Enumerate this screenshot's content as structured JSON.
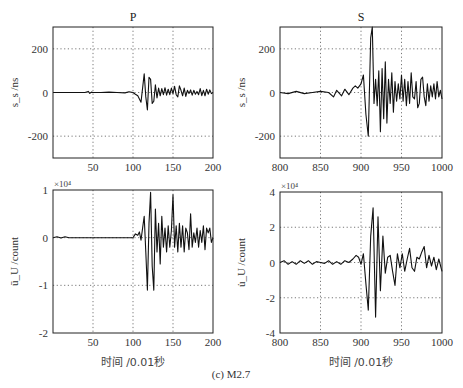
{
  "caption": "(c) M2.7",
  "chart_data": [
    {
      "id": "p-velocity",
      "type": "line",
      "title": "P",
      "xlabel": "",
      "ylabel": "s_s /ns",
      "xlim": [
        0,
        200
      ],
      "ylim": [
        -300,
        300
      ],
      "xticks": [
        50,
        100,
        150,
        200
      ],
      "yticks": [
        -200,
        0,
        200
      ],
      "grid": true,
      "exponent": "",
      "x": [
        0,
        10,
        20,
        30,
        40,
        44,
        46,
        48,
        50,
        60,
        70,
        80,
        90,
        95,
        100,
        103,
        106,
        108,
        110,
        112,
        114,
        116,
        118,
        120,
        122,
        124,
        126,
        128,
        130,
        132,
        134,
        136,
        138,
        140,
        142,
        144,
        146,
        148,
        150,
        152,
        154,
        156,
        158,
        160,
        162,
        164,
        166,
        168,
        170,
        172,
        174,
        176,
        178,
        180,
        182,
        184,
        186,
        188,
        190,
        192,
        194,
        196,
        198,
        200
      ],
      "values": [
        0,
        0,
        0,
        0,
        0,
        5,
        -4,
        2,
        0,
        0,
        2,
        0,
        -2,
        3,
        0,
        -8,
        -15,
        -30,
        -45,
        20,
        85,
        -20,
        -80,
        70,
        60,
        -50,
        -40,
        35,
        -25,
        20,
        -15,
        18,
        -10,
        22,
        -12,
        15,
        -10,
        20,
        -5,
        28,
        -10,
        -20,
        30,
        10,
        -15,
        20,
        -18,
        10,
        -5,
        12,
        -12,
        10,
        -8,
        5,
        -10,
        18,
        -14,
        10,
        -15,
        15,
        -8,
        12,
        -5,
        0
      ]
    },
    {
      "id": "s-velocity",
      "type": "line",
      "title": "S",
      "xlabel": "",
      "ylabel": "s_s /ns",
      "xlim": [
        800,
        1000
      ],
      "ylim": [
        -300,
        300
      ],
      "xticks": [
        800,
        850,
        900,
        950,
        1000
      ],
      "yticks": [
        -200,
        0,
        200
      ],
      "grid": true,
      "exponent": "",
      "x": [
        800,
        810,
        820,
        830,
        840,
        850,
        860,
        866,
        870,
        876,
        880,
        885,
        890,
        893,
        896,
        900,
        903,
        906,
        909,
        912,
        914,
        916,
        918,
        920,
        922,
        924,
        926,
        928,
        930,
        932,
        934,
        936,
        938,
        940,
        942,
        944,
        946,
        948,
        950,
        952,
        954,
        956,
        958,
        960,
        962,
        964,
        966,
        968,
        970,
        972,
        974,
        976,
        978,
        980,
        982,
        984,
        986,
        988,
        990,
        992,
        994,
        996,
        998,
        1000
      ],
      "values": [
        0,
        -5,
        5,
        -5,
        0,
        5,
        0,
        -20,
        10,
        -15,
        15,
        -10,
        20,
        30,
        20,
        40,
        80,
        -100,
        -200,
        250,
        300,
        -50,
        60,
        -60,
        100,
        -180,
        110,
        -120,
        140,
        -140,
        60,
        -50,
        90,
        -90,
        50,
        -40,
        40,
        -30,
        80,
        -40,
        60,
        -60,
        50,
        -50,
        90,
        -20,
        -30,
        50,
        -70,
        -50,
        60,
        70,
        -20,
        -60,
        40,
        -40,
        30,
        -20,
        40,
        -30,
        50,
        -20,
        10,
        -30
      ]
    },
    {
      "id": "p-acceleration",
      "type": "line",
      "title": "",
      "xlabel": "时间 /0.01秒",
      "ylabel": "ū_U /count",
      "xlim": [
        0,
        200
      ],
      "ylim": [
        -2,
        1
      ],
      "xticks": [
        50,
        100,
        150,
        200
      ],
      "yticks": [
        -2,
        -1,
        0,
        1
      ],
      "grid": true,
      "exponent": "×10⁴",
      "x": [
        0,
        5,
        10,
        15,
        20,
        30,
        40,
        50,
        60,
        70,
        80,
        90,
        100,
        103,
        106,
        108,
        110,
        112,
        114,
        116,
        118,
        120,
        122,
        124,
        126,
        128,
        130,
        132,
        134,
        136,
        138,
        140,
        142,
        144,
        146,
        148,
        150,
        152,
        154,
        156,
        158,
        160,
        162,
        164,
        166,
        168,
        170,
        172,
        174,
        176,
        178,
        180,
        182,
        184,
        186,
        188,
        190,
        192,
        194,
        196,
        198,
        200
      ],
      "values": [
        0,
        0.02,
        -0.01,
        0.02,
        0,
        0,
        0,
        0,
        0,
        0,
        0,
        0,
        0,
        0.08,
        0.05,
        0.12,
        -0.05,
        0.2,
        0.45,
        -0.3,
        -1.1,
        0.3,
        0.95,
        -0.6,
        -1.1,
        0.6,
        -0.3,
        0.3,
        -0.55,
        0.45,
        -0.2,
        0.2,
        -0.3,
        0.25,
        -0.2,
        0.15,
        0.9,
        -0.2,
        0.25,
        -0.3,
        0.3,
        -0.2,
        0.25,
        -0.3,
        0.2,
        0.1,
        -0.25,
        0.5,
        -0.2,
        0.1,
        -0.1,
        0.2,
        -0.2,
        0.15,
        -0.1,
        0.25,
        -0.25,
        0.2,
        0.1,
        0.2,
        -0.1,
        0
      ]
    },
    {
      "id": "s-acceleration",
      "type": "line",
      "title": "",
      "xlabel": "时间 /0.01秒",
      "ylabel": "u̇_U /count",
      "xlim": [
        800,
        1000
      ],
      "ylim": [
        -4,
        4
      ],
      "xticks": [
        800,
        850,
        900,
        950,
        1000
      ],
      "yticks": [
        -4,
        -2,
        0,
        2,
        4
      ],
      "grid": true,
      "exponent": "×10⁴",
      "x": [
        800,
        805,
        810,
        815,
        820,
        825,
        830,
        835,
        840,
        845,
        850,
        855,
        860,
        865,
        870,
        875,
        880,
        885,
        890,
        894,
        897,
        900,
        903,
        906,
        909,
        912,
        915,
        918,
        921,
        924,
        927,
        930,
        933,
        936,
        939,
        942,
        945,
        948,
        951,
        954,
        957,
        960,
        963,
        966,
        969,
        972,
        975,
        978,
        981,
        984,
        987,
        990,
        993,
        996,
        1000
      ],
      "values": [
        0,
        0.1,
        -0.1,
        0.05,
        -0.1,
        0.1,
        -0.05,
        0.1,
        -0.1,
        0.05,
        0,
        -0.05,
        0.1,
        -0.1,
        0.05,
        -0.1,
        0.1,
        0,
        0.2,
        0.4,
        0.3,
        -0.1,
        0.5,
        -1.2,
        -2.7,
        1.5,
        3.1,
        -3.1,
        2.6,
        -1.6,
        1.5,
        -0.6,
        0.3,
        0.4,
        -0.5,
        -1.3,
        0.5,
        -0.3,
        0.5,
        -0.5,
        0.2,
        0.8,
        -0.3,
        -0.5,
        0.3,
        0.2,
        0.6,
        0.9,
        -0.3,
        0.4,
        -0.2,
        0.3,
        -0.4,
        0.2,
        -0.5
      ]
    }
  ]
}
